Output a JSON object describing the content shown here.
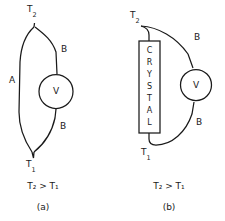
{
  "figure": {
    "background_color": "#ffffff",
    "line_color": "#1a1a1a"
  },
  "panel_a": {
    "id": "a",
    "caption": "(a)",
    "relation": "T₂ > T₁",
    "hot_junction_label": "T",
    "hot_junction_sub": "2",
    "cold_junction_label": "T",
    "cold_junction_sub": "1",
    "wire_a_label": "A",
    "wire_b_upper_label": "B",
    "wire_b_lower_label": "B",
    "meter_label": "V"
  },
  "panel_b": {
    "id": "b",
    "caption": "(b)",
    "relation": "T₂ > T₁",
    "hot_junction_label": "T",
    "hot_junction_sub": "2",
    "cold_junction_label": "T",
    "cold_junction_sub": "1",
    "wire_b_upper_label": "B",
    "wire_b_lower_label": "B",
    "meter_label": "V",
    "crystal_word": "CRYSTAL",
    "crystal_letters": [
      "C",
      "R",
      "Y",
      "S",
      "T",
      "A",
      "L"
    ]
  }
}
